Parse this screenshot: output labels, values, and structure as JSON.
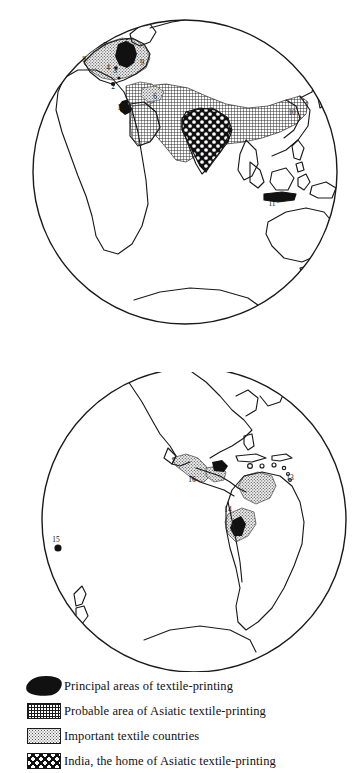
{
  "figure": {
    "type": "map",
    "projection": "orthographic-globe"
  },
  "globes": [
    {
      "id": "northern-eastern-hemisphere",
      "name": "eastern-hemisphere-globe",
      "markers": [
        {
          "id": "1",
          "label": "1",
          "x": 119,
          "y": 110
        },
        {
          "id": "2",
          "label": "2",
          "x": 113,
          "y": 89
        },
        {
          "id": "3",
          "label": "3",
          "x": 115,
          "y": 73
        },
        {
          "id": "4",
          "label": "4",
          "x": 108,
          "y": 70
        },
        {
          "id": "5",
          "label": "5",
          "x": 127,
          "y": 45
        },
        {
          "id": "6",
          "label": "6",
          "x": 155,
          "y": 99
        },
        {
          "id": "7",
          "label": "7",
          "x": 105,
          "y": 48
        },
        {
          "id": "8",
          "label": "8",
          "x": 84,
          "y": 62
        },
        {
          "id": "9",
          "label": "9",
          "x": 142,
          "y": 65
        },
        {
          "id": "10",
          "label": "10",
          "x": 292,
          "y": 115
        },
        {
          "id": "11",
          "label": "11",
          "x": 272,
          "y": 201
        },
        {
          "id": "12",
          "label": "12",
          "x": 202,
          "y": 155
        }
      ]
    },
    {
      "id": "western-hemisphere",
      "name": "western-hemisphere-globe",
      "markers": [
        {
          "id": "13",
          "label": "13",
          "x": 290,
          "y": 477
        },
        {
          "id": "14",
          "label": "14",
          "x": 243,
          "y": 508
        },
        {
          "id": "15",
          "label": "15",
          "x": 56,
          "y": 541
        },
        {
          "id": "16",
          "label": "16",
          "x": 197,
          "y": 478
        }
      ]
    }
  ],
  "legend": {
    "name": "map-legend",
    "entries": [
      {
        "swatch": "solid-black-blob",
        "label": "Principal areas of textile-printing"
      },
      {
        "swatch": "fine-grid-hatch",
        "label": "Probable area of Asiatic textile-printing"
      },
      {
        "swatch": "light-stipple",
        "label": "Important textile countries"
      },
      {
        "swatch": "bold-checker",
        "label": "India, the home of Asiatic textile-printing"
      }
    ]
  },
  "colors": {
    "ink": "#111111",
    "paper": "#ffffff",
    "stipple_fill": "#d9d9d9",
    "grid_fill": "#9a9a9a"
  }
}
